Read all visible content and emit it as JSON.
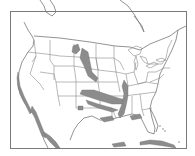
{
  "map": {
    "title": "",
    "subject": "Continental United States with shaded regions",
    "colors": {
      "background": "#ffffff",
      "frame": "#7a7a7a",
      "borders": "#8a8a8a",
      "shaded_regions": "#8c8c8c"
    },
    "shaded_areas": [
      "Pacific coast California",
      "Baja California peninsula",
      "Mexican Pacific coast",
      "Northern Great Plains / Montana-North Dakota",
      "Nebraska-Kansas-Oklahoma plains band",
      "Mississippi River valley",
      "Texas Gulf coast",
      "Florida Gulf coast",
      "Cuba"
    ]
  }
}
